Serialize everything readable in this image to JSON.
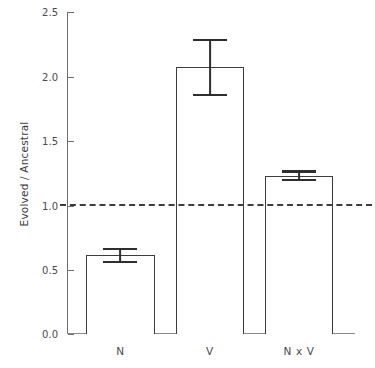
{
  "chart_data": {
    "type": "bar",
    "title": "",
    "xlabel": "",
    "ylabel": "Evolved / Ancestral",
    "categories": [
      "N",
      "V",
      "N x V"
    ],
    "values": [
      0.61,
      2.07,
      1.23
    ],
    "errors": [
      0.06,
      0.22,
      0.04
    ],
    "error_type": "symmetric",
    "ylim": [
      0.0,
      2.5
    ],
    "yticks": [
      0.0,
      0.5,
      1.0,
      1.5,
      2.0,
      2.5
    ],
    "ytick_labels": [
      "0.0",
      "0.5",
      "1.0",
      "1.5",
      "2.0",
      "2.5"
    ],
    "grid": false,
    "legend": null,
    "reference_line": {
      "value": 1.0,
      "style": "dashed",
      "color": "#3d3d3d"
    },
    "bar_style": {
      "fill": "#ffffff",
      "edge": "#3d3d3d"
    }
  },
  "axis": {
    "y_label": "Evolved / Ancestral",
    "tick_0": "0.0",
    "tick_1": "0.5",
    "tick_2": "1.0",
    "tick_3": "1.5",
    "tick_4": "2.0",
    "tick_5": "2.5"
  },
  "categories": {
    "c0": "N",
    "c1": "V",
    "c2": "N x V"
  }
}
